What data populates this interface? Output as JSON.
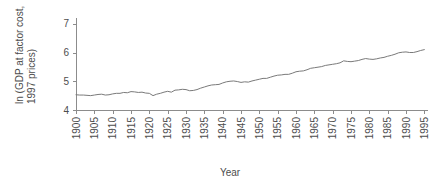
{
  "chart_data": {
    "type": "line",
    "title": "",
    "xlabel": "Year",
    "ylabel": "ln (GDP at factor cost, 1997 prices)",
    "ylabel_line1": "ln (GDP at factor cost,",
    "ylabel_line2": "1997 prices)",
    "xlim": [
      1900,
      1996
    ],
    "ylim": [
      4,
      7.2
    ],
    "grid": false,
    "legend": false,
    "legend_position": "none",
    "yticks": [
      4,
      5,
      6,
      7
    ],
    "ytick_labels": [
      "4",
      "5",
      "6",
      "7"
    ],
    "xticks": [
      1900,
      1905,
      1910,
      1915,
      1920,
      1925,
      1930,
      1935,
      1940,
      1945,
      1950,
      1955,
      1960,
      1965,
      1970,
      1975,
      1980,
      1985,
      1990,
      1995
    ],
    "xtick_labels": [
      "1900",
      "1905",
      "1910",
      "1915",
      "1920",
      "1925",
      "1930",
      "1935",
      "1940",
      "1945",
      "1950",
      "1955",
      "1960",
      "1965",
      "1970",
      "1975",
      "1980",
      "1985",
      "1990",
      "1995"
    ],
    "series": [
      {
        "name": "ln GDP at factor cost (1997 prices)",
        "color": "#7a7a7a",
        "x": [
          1900,
          1901,
          1902,
          1903,
          1904,
          1905,
          1906,
          1907,
          1908,
          1909,
          1910,
          1911,
          1912,
          1913,
          1914,
          1915,
          1916,
          1917,
          1918,
          1919,
          1920,
          1921,
          1922,
          1923,
          1924,
          1925,
          1926,
          1927,
          1928,
          1929,
          1930,
          1931,
          1932,
          1933,
          1934,
          1935,
          1936,
          1937,
          1938,
          1939,
          1940,
          1941,
          1942,
          1943,
          1944,
          1945,
          1946,
          1947,
          1948,
          1949,
          1950,
          1951,
          1952,
          1953,
          1954,
          1955,
          1956,
          1957,
          1958,
          1959,
          1960,
          1961,
          1962,
          1963,
          1964,
          1965,
          1966,
          1967,
          1968,
          1969,
          1970,
          1971,
          1972,
          1973,
          1974,
          1975,
          1976,
          1977,
          1978,
          1979,
          1980,
          1981,
          1982,
          1983,
          1984,
          1985,
          1986,
          1987,
          1988,
          1989,
          1990,
          1991,
          1992,
          1993,
          1994,
          1995
        ],
        "y": [
          4.53,
          4.52,
          4.52,
          4.51,
          4.5,
          4.52,
          4.54,
          4.55,
          4.52,
          4.53,
          4.56,
          4.58,
          4.58,
          4.61,
          4.6,
          4.64,
          4.63,
          4.61,
          4.62,
          4.59,
          4.58,
          4.5,
          4.55,
          4.58,
          4.62,
          4.65,
          4.62,
          4.69,
          4.7,
          4.72,
          4.71,
          4.67,
          4.68,
          4.71,
          4.76,
          4.8,
          4.84,
          4.87,
          4.88,
          4.89,
          4.94,
          4.98,
          5.0,
          5.01,
          4.99,
          4.96,
          4.98,
          4.97,
          5.01,
          5.04,
          5.07,
          5.1,
          5.1,
          5.14,
          5.18,
          5.21,
          5.22,
          5.24,
          5.24,
          5.28,
          5.33,
          5.35,
          5.36,
          5.4,
          5.45,
          5.47,
          5.49,
          5.51,
          5.55,
          5.57,
          5.59,
          5.61,
          5.64,
          5.71,
          5.69,
          5.68,
          5.7,
          5.72,
          5.76,
          5.79,
          5.77,
          5.76,
          5.78,
          5.81,
          5.83,
          5.87,
          5.9,
          5.94,
          5.99,
          6.01,
          6.02,
          6.0,
          6.0,
          6.03,
          6.07,
          6.1
        ]
      }
    ]
  },
  "axis": {
    "y_tick_color": "#4d4d4d",
    "x_tick_color": "#4d4d4d",
    "line_color": "#8c8c8c"
  }
}
